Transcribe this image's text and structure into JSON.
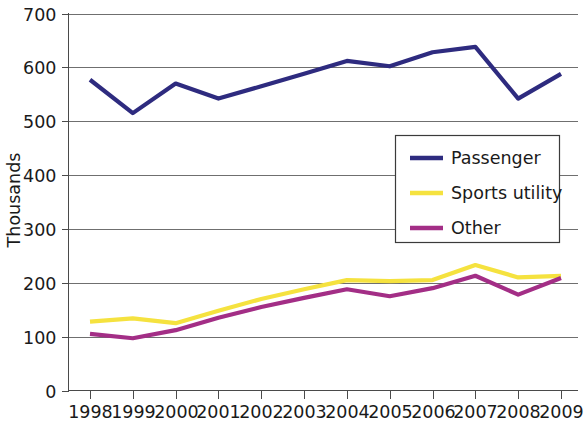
{
  "chart_data": {
    "type": "line",
    "title": "",
    "subtitle": "",
    "xlabel": "",
    "ylabel": "Thousands",
    "x": [
      1998,
      1999,
      2000,
      2001,
      2002,
      2003,
      2004,
      2005,
      2006,
      2007,
      2008,
      2009
    ],
    "categories": [
      "1998",
      "1999",
      "2000",
      "2001",
      "2002",
      "2003",
      "2004",
      "2005",
      "2006",
      "2007",
      "2008",
      "2009"
    ],
    "xlim": [
      1998,
      2009
    ],
    "ylim": [
      0,
      700
    ],
    "yticks": [
      0,
      100,
      200,
      300,
      400,
      500,
      600,
      700
    ],
    "ytick_labels": [
      "0",
      "100",
      "200",
      "300",
      "400",
      "500",
      "600",
      "700"
    ],
    "grid": true,
    "grid_axis": "y",
    "legend_position": "center-right",
    "series": [
      {
        "name": "Passenger",
        "color": "#2e2b7f",
        "values": [
          577,
          515,
          570,
          542,
          565,
          588,
          612,
          602,
          628,
          638,
          542,
          588
        ]
      },
      {
        "name": "Sports utility",
        "color": "#f5e23f",
        "values": [
          128,
          134,
          125,
          148,
          170,
          188,
          205,
          203,
          205,
          233,
          210,
          213
        ]
      },
      {
        "name": "Other",
        "color": "#a32e86",
        "values": [
          105,
          97,
          112,
          135,
          155,
          172,
          188,
          175,
          190,
          213,
          178,
          209
        ]
      }
    ]
  },
  "axes": {
    "y_axis_title": "Thousands",
    "y_tick_labels": [
      "700",
      "600",
      "500",
      "400",
      "300",
      "200",
      "100",
      "0"
    ],
    "x_tick_labels": [
      "1998",
      "1999",
      "2000",
      "2001",
      "2002",
      "2003",
      "2004",
      "2005",
      "2006",
      "2007",
      "2008",
      "2009"
    ]
  },
  "legend": {
    "items": [
      {
        "label": "Passenger",
        "color": "#2e2b7f"
      },
      {
        "label": "Sports utility",
        "color": "#f5e23f"
      },
      {
        "label": "Other",
        "color": "#a32e86"
      }
    ]
  },
  "colors": {
    "passenger": "#2e2b7f",
    "sports_utility": "#f5e23f",
    "other": "#a32e86",
    "gridline": "#6f6f6f",
    "axis": "#4a4a4a",
    "text": "#1a1a1a",
    "background": "#ffffff"
  }
}
